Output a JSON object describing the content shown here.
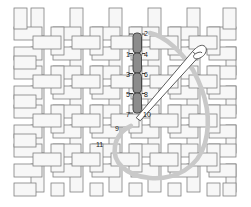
{
  "figure": {
    "type": "needlework-stitch-diagram",
    "canvas": {
      "x": 14,
      "y": 8,
      "width": 222,
      "height": 188,
      "cell": 19.5,
      "cols": 11,
      "rows": 9,
      "thread_fill": "#f7f7f7",
      "thread_stroke": "#808080",
      "weave": "plain-weave-basket"
    },
    "stitches": {
      "color": "#8a8a8a",
      "stroke": "#3c3c3c",
      "orientation": "vertical",
      "count": 4,
      "x": 133.5,
      "width": 8,
      "segments": [
        {
          "y": 33,
          "height": 20
        },
        {
          "y": 53,
          "height": 20
        },
        {
          "y": 73,
          "height": 20
        },
        {
          "y": 93,
          "height": 20
        }
      ]
    },
    "labels": [
      {
        "text": "2",
        "x": 144,
        "y": 36
      },
      {
        "text": "1",
        "x": 127,
        "y": 56
      },
      {
        "text": "4",
        "x": 144,
        "y": 56
      },
      {
        "text": "3",
        "x": 127,
        "y": 76
      },
      {
        "text": "6",
        "x": 144,
        "y": 76
      },
      {
        "text": "5",
        "x": 127,
        "y": 96
      },
      {
        "text": "8",
        "x": 144,
        "y": 96
      },
      {
        "text": "7",
        "x": 127,
        "y": 116
      },
      {
        "text": "10",
        "x": 144,
        "y": 116
      },
      {
        "text": "9",
        "x": 116,
        "y": 130
      },
      {
        "text": "11",
        "x": 97,
        "y": 146
      }
    ],
    "needle": {
      "color": "#ffffff",
      "stroke": "#4a4a4a",
      "tip": {
        "x": 137,
        "y": 117
      },
      "eye": {
        "x": 201,
        "y": 49
      },
      "description": "blunt tapestry needle, eye at upper right, tip at lower left"
    },
    "thread": {
      "color": "#c9c9c9",
      "width": 4.5,
      "description": "thick gray yarn leaving stitch top, looping right and down, returning to canvas at point 9"
    }
  }
}
